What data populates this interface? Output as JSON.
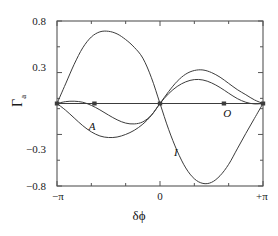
{
  "figure": {
    "background": "#ffffff",
    "line_color": "#3c3c3c",
    "axis_color": "#555555"
  },
  "axes": {
    "ylabel_main": "Γ",
    "ylabel_sub": "a",
    "xlabel": "δϕ",
    "yticks": [
      {
        "value": 0.8,
        "label": "0.8"
      },
      {
        "value": 0.3,
        "label": "0.3"
      },
      {
        "value": -0.3,
        "label": "−0.3"
      },
      {
        "value": -0.8,
        "label": "−0.8"
      }
    ],
    "yticks_minor": [
      0.55,
      0.05,
      -0.05,
      -0.55
    ],
    "xticks": [
      {
        "value": -3.14159,
        "label": "−π"
      },
      {
        "value": 0.0,
        "label": "0"
      },
      {
        "value": 3.14159,
        "label": "+π"
      }
    ],
    "xticks_minor": [
      -2.0944,
      -1.0472,
      1.0472,
      2.0944
    ],
    "xlim": [
      -3.14159,
      3.14159
    ],
    "ylim": [
      -0.8,
      0.8
    ],
    "grid": false,
    "frame": true
  },
  "curve_labels": [
    {
      "id": "A",
      "text": "A",
      "x": -2.05,
      "y": -0.23
    },
    {
      "id": "I",
      "text": "I",
      "x": 0.55,
      "y": -0.48
    },
    {
      "id": "O",
      "text": "O",
      "x": 2.05,
      "y": -0.1
    }
  ],
  "markers": [
    {
      "x": -3.14159,
      "y": 0.0
    },
    {
      "x": -2.0,
      "y": 0.0
    },
    {
      "x": 0.0,
      "y": 0.0
    },
    {
      "x": 1.95,
      "y": 0.0
    },
    {
      "x": 3.14159,
      "y": 0.0
    }
  ],
  "chart_data": {
    "type": "line",
    "title": "",
    "xlabel": "δϕ",
    "ylabel": "Γa",
    "xlim": [
      -3.14159,
      3.14159
    ],
    "ylim": [
      -0.8,
      0.8
    ],
    "grid": false,
    "legend": "inline-curve-labels",
    "x": [
      -3.14159,
      -2.87979,
      -2.61799,
      -2.35619,
      -2.0944,
      -1.8326,
      -1.5708,
      -1.309,
      -1.0472,
      -0.7854,
      -0.5236,
      -0.2618,
      0.0,
      0.2618,
      0.5236,
      0.7854,
      1.0472,
      1.309,
      1.5708,
      1.8326,
      2.0944,
      2.35619,
      2.61799,
      2.87979,
      3.14159
    ],
    "series": [
      {
        "name": "big-lobe",
        "label": "",
        "values": [
          0.0,
          0.19,
          0.38,
          0.54,
          0.645,
          0.695,
          0.7,
          0.675,
          0.62,
          0.545,
          0.44,
          0.25,
          0.0,
          -0.25,
          -0.46,
          -0.625,
          -0.73,
          -0.775,
          -0.765,
          -0.7,
          -0.59,
          -0.44,
          -0.29,
          -0.145,
          0.0
        ]
      },
      {
        "name": "curve-A",
        "label": "A",
        "values": [
          0.0,
          -0.065,
          -0.14,
          -0.215,
          -0.275,
          -0.315,
          -0.33,
          -0.325,
          -0.3,
          -0.26,
          -0.2,
          -0.115,
          0.0,
          0.115,
          0.215,
          0.285,
          0.32,
          0.325,
          0.3,
          0.255,
          0.195,
          0.135,
          0.085,
          0.035,
          0.0
        ]
      },
      {
        "name": "curve-O",
        "label": "O",
        "values": [
          0.0,
          0.018,
          0.022,
          0.012,
          -0.018,
          -0.062,
          -0.112,
          -0.158,
          -0.19,
          -0.198,
          -0.178,
          -0.112,
          0.0,
          0.095,
          0.165,
          0.21,
          0.232,
          0.228,
          0.2,
          0.155,
          0.1,
          0.048,
          0.012,
          -0.004,
          0.0
        ]
      },
      {
        "name": "zero-line",
        "label": "",
        "values": [
          0.0,
          0.0,
          0.0,
          0.0,
          0.0,
          0.0,
          0.0,
          0.0,
          0.0,
          0.0,
          0.0,
          0.0,
          0.0,
          0.0,
          0.0,
          0.0,
          0.0,
          0.0,
          0.0,
          0.0,
          0.0,
          0.0,
          0.0,
          0.0,
          0.0
        ]
      }
    ]
  }
}
